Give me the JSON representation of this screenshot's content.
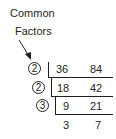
{
  "label": {
    "line1": "Common",
    "line2": "Factors"
  },
  "rows": [
    {
      "divisor": "2",
      "a": "36",
      "b": "84"
    },
    {
      "divisor": "2",
      "a": "18",
      "b": "42"
    },
    {
      "divisor": "3",
      "a": "9",
      "b": "21"
    },
    {
      "a": "3",
      "b": "7"
    }
  ],
  "icons": {
    "arrow": "arrow-down-right-icon"
  }
}
